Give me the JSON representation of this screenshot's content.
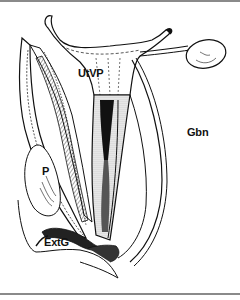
{
  "figure": {
    "type": "anatomical line drawing (sagittal section)",
    "labels": {
      "utvp": "UtVP",
      "gbn": "Gbn",
      "p": "P",
      "extg": "ExtG"
    },
    "colors": {
      "ink": "#111111",
      "background": "#ffffff",
      "rule": "#8a8a8a",
      "stipple": "#bdbdbd"
    }
  }
}
